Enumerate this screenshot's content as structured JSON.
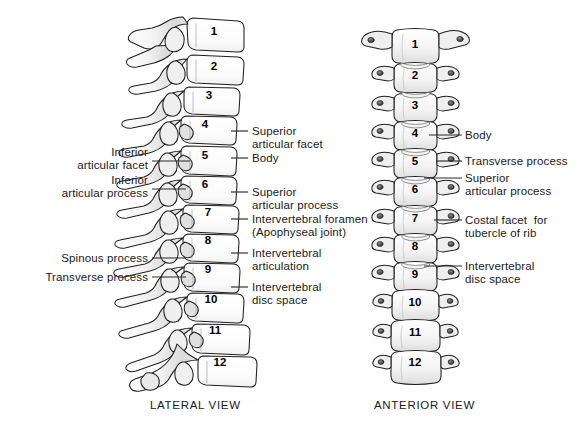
{
  "figure": {
    "background_color": "#ffffff",
    "ink_color": "#1a1a1a",
    "bone_fill": "#fdfdfd",
    "bone_shade": "#e4e4e4",
    "bone_shade_dark": "#c9c9c9",
    "leader_color": "#2b2b2b"
  },
  "captions": [
    {
      "text": "LATERAL VIEW",
      "x": 150,
      "y": 399
    },
    {
      "text": "ANTERIOR VIEW",
      "x": 374,
      "y": 399
    }
  ],
  "lateral_view": {
    "name": "LATERAL VIEW",
    "vertebra_numbers": [
      "1",
      "2",
      "3",
      "4",
      "5",
      "6",
      "7",
      "8",
      "9",
      "10",
      "11",
      "12"
    ],
    "number_positions": [
      {
        "label": "1",
        "x": 214,
        "y": 32
      },
      {
        "label": "2",
        "x": 214,
        "y": 67
      },
      {
        "label": "3",
        "x": 209,
        "y": 96
      },
      {
        "label": "4",
        "x": 205,
        "y": 125
      },
      {
        "label": "5",
        "x": 205,
        "y": 156
      },
      {
        "label": "6",
        "x": 205,
        "y": 185
      },
      {
        "label": "7",
        "x": 208,
        "y": 213
      },
      {
        "label": "8",
        "x": 208,
        "y": 241
      },
      {
        "label": "9",
        "x": 208,
        "y": 270
      },
      {
        "label": "10",
        "x": 211,
        "y": 300
      },
      {
        "label": "11",
        "x": 215,
        "y": 331
      },
      {
        "label": "12",
        "x": 220,
        "y": 363
      }
    ],
    "left_labels": [
      {
        "lines": [
          "Inferior",
          "articular facet"
        ],
        "text_right_x": 148,
        "first_line_y": 146,
        "leader": {
          "x1": 152,
          "y1": 161,
          "x2": 190,
          "y2": 161
        }
      },
      {
        "lines": [
          "Inferior",
          "articular process"
        ],
        "text_right_x": 148,
        "first_line_y": 174,
        "leader": {
          "x1": 152,
          "y1": 189,
          "x2": 186,
          "y2": 189
        }
      },
      {
        "lines": [
          "Spinous process"
        ],
        "text_right_x": 148,
        "first_line_y": 252,
        "leader": {
          "x1": 152,
          "y1": 258,
          "x2": 186,
          "y2": 258
        }
      },
      {
        "lines": [
          "Transverse process"
        ],
        "text_right_x": 148,
        "first_line_y": 271,
        "leader": {
          "x1": 152,
          "y1": 277,
          "x2": 186,
          "y2": 277
        }
      }
    ],
    "right_labels": [
      {
        "lines": [
          "Superior",
          "articular facet"
        ],
        "text_left_x": 252,
        "first_line_y": 125,
        "leader": {
          "x1": 231,
          "y1": 131,
          "x2": 248,
          "y2": 131
        }
      },
      {
        "lines": [
          "Body"
        ],
        "text_left_x": 252,
        "first_line_y": 152,
        "leader": {
          "x1": 231,
          "y1": 158,
          "x2": 248,
          "y2": 158
        }
      },
      {
        "lines": [
          "Superior",
          "articular process"
        ],
        "text_left_x": 252,
        "first_line_y": 186,
        "leader": {
          "x1": 231,
          "y1": 192,
          "x2": 248,
          "y2": 192
        }
      },
      {
        "lines": [
          "Intervertebral foramen",
          "(Apophyseal joint)"
        ],
        "text_left_x": 252,
        "first_line_y": 213,
        "leader": {
          "x1": 231,
          "y1": 219,
          "x2": 248,
          "y2": 219
        }
      },
      {
        "lines": [
          "Intervertebral",
          "articulation"
        ],
        "text_left_x": 252,
        "first_line_y": 247,
        "leader": {
          "x1": 231,
          "y1": 253,
          "x2": 248,
          "y2": 253
        }
      },
      {
        "lines": [
          "Intervertebral",
          "disc space"
        ],
        "text_left_x": 252,
        "first_line_y": 281,
        "leader": {
          "x1": 231,
          "y1": 287,
          "x2": 248,
          "y2": 287
        }
      }
    ]
  },
  "anterior_view": {
    "name": "ANTERIOR VIEW",
    "vertebra_numbers": [
      "1",
      "2",
      "3",
      "4",
      "5",
      "6",
      "7",
      "8",
      "9",
      "10",
      "11",
      "12"
    ],
    "number_positions": [
      {
        "label": "1",
        "x": 415,
        "y": 45
      },
      {
        "label": "2",
        "x": 415,
        "y": 76
      },
      {
        "label": "3",
        "x": 415,
        "y": 106
      },
      {
        "label": "4",
        "x": 415,
        "y": 134
      },
      {
        "label": "5",
        "x": 415,
        "y": 162
      },
      {
        "label": "6",
        "x": 415,
        "y": 190
      },
      {
        "label": "7",
        "x": 415,
        "y": 219
      },
      {
        "label": "8",
        "x": 415,
        "y": 247
      },
      {
        "label": "9",
        "x": 415,
        "y": 275
      },
      {
        "label": "10",
        "x": 415,
        "y": 303
      },
      {
        "label": "11",
        "x": 415,
        "y": 333
      },
      {
        "label": "12",
        "x": 415,
        "y": 363
      }
    ],
    "right_labels": [
      {
        "lines": [
          "Body"
        ],
        "text_left_x": 465,
        "first_line_y": 129,
        "leader": {
          "x1": 429,
          "y1": 135,
          "x2": 462,
          "y2": 135
        }
      },
      {
        "lines": [
          "Transverse process"
        ],
        "text_left_x": 465,
        "first_line_y": 155,
        "leader": {
          "x1": 436,
          "y1": 161,
          "x2": 462,
          "y2": 161
        }
      },
      {
        "lines": [
          "Superior",
          "articular process"
        ],
        "text_left_x": 465,
        "first_line_y": 172,
        "leader": {
          "x1": 424,
          "y1": 178,
          "x2": 462,
          "y2": 178
        }
      },
      {
        "lines": [
          "Costal facet  for",
          "tubercle of rib"
        ],
        "text_left_x": 465,
        "first_line_y": 214,
        "leader": {
          "x1": 434,
          "y1": 220,
          "x2": 462,
          "y2": 220
        }
      },
      {
        "lines": [
          "Intervertebral",
          "disc space"
        ],
        "text_left_x": 465,
        "first_line_y": 260,
        "leader": {
          "x1": 424,
          "y1": 266,
          "x2": 462,
          "y2": 266
        }
      }
    ]
  }
}
